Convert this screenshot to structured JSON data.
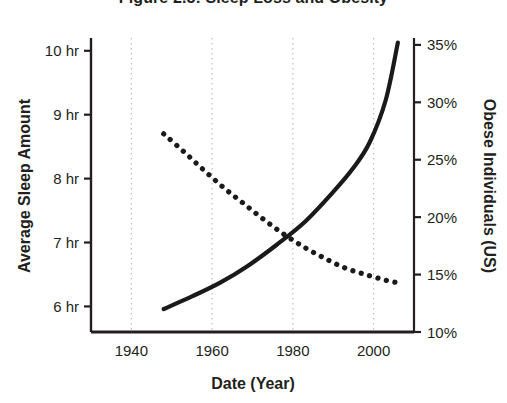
{
  "chart_data": {
    "type": "line",
    "title": "Figure 2.5: Sleep Loss and Obesity",
    "xlabel": "Date (Year)",
    "ylabel": "Average Sleep Amount",
    "y2label": "Obese Individuals (US)",
    "xlim": [
      1930,
      2010
    ],
    "ylim": [
      5.6,
      10.2
    ],
    "y2lim": [
      10,
      35.6
    ],
    "grid": "vertical-dotted",
    "legend": "none",
    "xticks": [
      1940,
      1960,
      1980,
      2000
    ],
    "xtick_labels": [
      "1940",
      "1960",
      "1980",
      "2000"
    ],
    "yticks": [
      6,
      7,
      8,
      9,
      10
    ],
    "ytick_labels": [
      "6 hr",
      "7 hr",
      "8 hr",
      "9 hr",
      "10 hr"
    ],
    "y2ticks": [
      10,
      15,
      20,
      25,
      30,
      35
    ],
    "y2tick_labels": [
      "10%",
      "15%",
      "20%",
      "25%",
      "30%",
      "35%"
    ],
    "series": [
      {
        "name": "Average Sleep Amount",
        "axis": "left",
        "style": "dotted",
        "color": "#1a1a1a",
        "x": [
          1948,
          1953,
          1958,
          1963,
          1968,
          1973,
          1978,
          1983,
          1988,
          1993,
          1998,
          2003,
          2006
        ],
        "values": [
          8.7,
          8.42,
          8.13,
          7.85,
          7.6,
          7.35,
          7.12,
          6.92,
          6.75,
          6.6,
          6.5,
          6.41,
          6.37
        ]
      },
      {
        "name": "Obese Individuals (US)",
        "axis": "right",
        "style": "solid",
        "color": "#1a1a1a",
        "x": [
          1948,
          1955,
          1962,
          1969,
          1976,
          1983,
          1990,
          1995,
          1999,
          2003,
          2006
        ],
        "values": [
          12.0,
          13.1,
          14.3,
          15.8,
          17.6,
          19.6,
          22.2,
          24.3,
          26.5,
          30.2,
          35.2
        ]
      }
    ],
    "crossing_point": {
      "x": 1975,
      "left_value": 7.15,
      "right_value": 18.0
    }
  },
  "axes": {
    "left_tick_unit": "hr",
    "right_tick_unit": "%"
  }
}
